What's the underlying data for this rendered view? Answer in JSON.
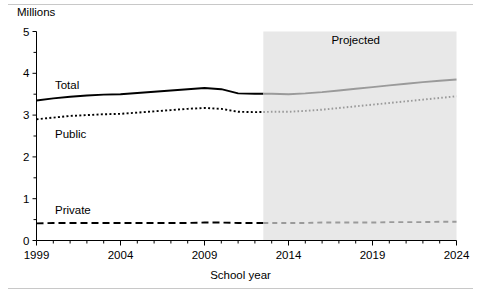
{
  "chart_data": {
    "type": "line",
    "title": "",
    "xlabel": "School year",
    "ylabel": "Millions",
    "ylim": [
      0,
      5
    ],
    "xlim": [
      1999,
      2024
    ],
    "grid": false,
    "legend_position": "inline-annotations",
    "y_tick_labels": [
      "0",
      "1",
      "2",
      "3",
      "4",
      "5"
    ],
    "y_tick_values": [
      0,
      1,
      2,
      3,
      4,
      5
    ],
    "y_minor_step": 0.5,
    "x_tick_labels": [
      "1999",
      "2004",
      "2009",
      "2014",
      "2019",
      "2024"
    ],
    "x_tick_values": [
      1999,
      2004,
      2009,
      2014,
      2019,
      2024
    ],
    "x_minor_step": 1,
    "annotations": [
      {
        "text": "Projected",
        "x": 2018,
        "y": 4.79
      },
      {
        "text": "Total",
        "x": 2000.1,
        "y": 3.72
      },
      {
        "text": "Public",
        "x": 2000.1,
        "y": 2.55
      },
      {
        "text": "Private",
        "x": 2000.1,
        "y": 0.73
      }
    ],
    "projected_region": {
      "start_year": 2012.5,
      "end_year": 2024,
      "label": "Projected",
      "shade_color": "#e8e8e8"
    },
    "x": [
      1999,
      2000,
      2001,
      2002,
      2003,
      2004,
      2005,
      2006,
      2007,
      2008,
      2009,
      2010,
      2011,
      2012,
      2013,
      2014,
      2015,
      2016,
      2017,
      2018,
      2019,
      2020,
      2021,
      2022,
      2023,
      2024
    ],
    "series": [
      {
        "name": "Total",
        "style": "solid",
        "color": "#000000",
        "projected_color": "#9a9a9a",
        "values": [
          3.35,
          3.4,
          3.44,
          3.47,
          3.49,
          3.5,
          3.53,
          3.56,
          3.59,
          3.62,
          3.65,
          3.62,
          3.52,
          3.51,
          3.51,
          3.5,
          3.52,
          3.55,
          3.59,
          3.63,
          3.67,
          3.71,
          3.75,
          3.79,
          3.82,
          3.85
        ]
      },
      {
        "name": "Public",
        "style": "dotted",
        "color": "#000000",
        "projected_color": "#9a9a9a",
        "values": [
          2.9,
          2.94,
          2.98,
          3.0,
          3.02,
          3.03,
          3.06,
          3.09,
          3.12,
          3.15,
          3.17,
          3.15,
          3.08,
          3.07,
          3.08,
          3.08,
          3.1,
          3.13,
          3.17,
          3.21,
          3.25,
          3.29,
          3.33,
          3.37,
          3.41,
          3.45
        ]
      },
      {
        "name": "Private",
        "style": "dashed",
        "color": "#000000",
        "projected_color": "#9a9a9a",
        "values": [
          0.41,
          0.42,
          0.42,
          0.42,
          0.42,
          0.42,
          0.42,
          0.42,
          0.42,
          0.42,
          0.43,
          0.43,
          0.42,
          0.42,
          0.42,
          0.42,
          0.42,
          0.43,
          0.43,
          0.43,
          0.43,
          0.44,
          0.44,
          0.44,
          0.45,
          0.45
        ]
      }
    ]
  },
  "axes": {
    "y_title": "Millions",
    "x_title": "School year"
  },
  "colors": {
    "ink": "#000000",
    "projected_ink": "#9a9a9a",
    "shade": "#e8e8e8",
    "rule": "#c8c8c8"
  }
}
